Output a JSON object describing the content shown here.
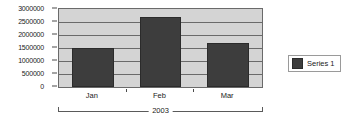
{
  "chart_data": {
    "type": "bar",
    "title": "",
    "xlabel": "2003",
    "ylabel": "",
    "categories": [
      "Jan",
      "Feb",
      "Mar"
    ],
    "series": [
      {
        "name": "Series 1",
        "values": [
          1500000,
          2700000,
          1700000
        ]
      }
    ],
    "ylim": [
      0,
      3000000
    ],
    "ytick_labels": [
      "3000000",
      "2500000",
      "2000000",
      "1500000",
      "1000000",
      "500000",
      "0"
    ],
    "ytick_values": [
      3000000,
      2500000,
      2000000,
      1500000,
      1000000,
      500000,
      0
    ],
    "grid": true,
    "legend_position": "right",
    "colors": {
      "bar": "#3d3d3d",
      "plot_background": "#d4d4d4",
      "gridline": "#6a6a6a",
      "axis": "#4a4a4a",
      "text": "#1a1a1a",
      "page_background": "#ffffff"
    }
  },
  "legend": {
    "entries": [
      {
        "label": "Series 1",
        "color": "#3d3d3d"
      }
    ]
  },
  "group_axis": {
    "label": "2003"
  }
}
